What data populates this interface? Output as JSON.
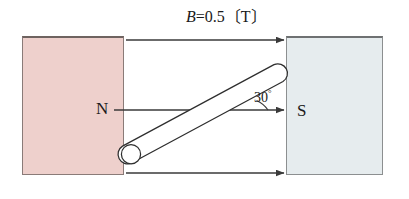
{
  "diagram": {
    "title_label": "B=0.5〔T〕",
    "field_symbol": "B",
    "field_equals_value": "=0.5",
    "field_unit_bracketed": "〔T〕",
    "field_magnitude": 0.5,
    "field_unit": "T",
    "angle_value": "30",
    "angle_degree_symbol": "°",
    "angle_degrees": 30,
    "north_pole_label": "N",
    "south_pole_label": "S",
    "colors": {
      "north_pole_fill": "#eed0cc",
      "south_pole_fill": "#e6ecee",
      "north_pole_border": "#8a7b78",
      "south_pole_border": "#8c8f90",
      "line_stroke": "#3a3a3a",
      "rod_fill": "#ffffff",
      "rod_stroke": "#2e2e2e",
      "background": "#ffffff",
      "text": "#1a1a1a"
    },
    "field_lines": [
      {
        "name": "top-field-line",
        "y": 40
      },
      {
        "name": "middle-field-line",
        "y": 110
      },
      {
        "name": "bottom-field-line",
        "y": 173
      }
    ],
    "rod": {
      "label": "conducting-rod",
      "lower_end_x": 131,
      "lower_end_y": 154,
      "upper_end_x": 283,
      "upper_end_y": 72
    }
  }
}
